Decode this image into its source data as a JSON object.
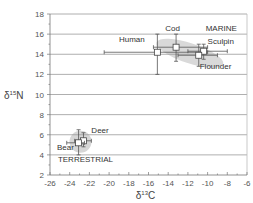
{
  "chart_data": {
    "type": "scatter",
    "title": "",
    "xlabel": "δ13C",
    "ylabel": "δ15N",
    "xlabel_parts": {
      "base": "δ",
      "sup": "13",
      "rest": "C"
    },
    "ylabel_parts": {
      "base": "δ",
      "sup": "15",
      "rest": "N"
    },
    "xlim": [
      -26,
      -6
    ],
    "ylim": [
      2,
      18
    ],
    "x_ticks": [
      -26,
      -24,
      -22,
      -20,
      -18,
      -16,
      -14,
      -12,
      -10,
      -8,
      -6
    ],
    "y_ticks": [
      2,
      4,
      6,
      8,
      10,
      12,
      14,
      16,
      18
    ],
    "grid": {
      "horizontal": true,
      "vertical": false
    },
    "legend": null,
    "series": [
      {
        "name": "Human",
        "x": -15.1,
        "y": 14.2,
        "x_err": [
          -20.5,
          -10.0
        ],
        "y_err": [
          12.0,
          16.0
        ]
      },
      {
        "name": "Cod",
        "x": -13.2,
        "y": 14.7,
        "x_err": [
          -15.5,
          -10.0
        ],
        "y_err": [
          13.3,
          16.0
        ]
      },
      {
        "name": "Sculpin",
        "x": -10.4,
        "y": 14.3,
        "x_err": [
          -12.0,
          -8.0
        ],
        "y_err": [
          13.5,
          15.0
        ]
      },
      {
        "name": "Flounder",
        "x": -10.9,
        "y": 13.9,
        "x_err": [
          -13.0,
          -9.0
        ],
        "y_err": [
          12.8,
          15.0
        ]
      },
      {
        "name": "Deer",
        "x": -22.6,
        "y": 5.4,
        "x_err": [
          -23.5,
          -21.8
        ],
        "y_err": [
          4.8,
          6.2
        ]
      },
      {
        "name": "Bear",
        "x": -23.1,
        "y": 5.2,
        "x_err": [
          -24.3,
          -22.5
        ],
        "y_err": [
          4.0,
          6.5
        ]
      }
    ],
    "annotations": [
      {
        "text": "MARINE",
        "x": -10.2,
        "y": 16.3
      },
      {
        "text": "TERRESTRIAL",
        "x": -25.2,
        "y": 3.3
      },
      {
        "text": "Human",
        "x": -19.0,
        "y": 15.2
      },
      {
        "text": "Cod",
        "x": -14.3,
        "y": 16.3
      },
      {
        "text": "Sculpin",
        "x": -10.0,
        "y": 15.0
      },
      {
        "text": "Flounder",
        "x": -10.8,
        "y": 12.5
      },
      {
        "text": "Deer",
        "x": -21.8,
        "y": 6.2
      },
      {
        "text": "Bear",
        "x": -25.3,
        "y": 4.5
      }
    ],
    "regions": [
      {
        "name": "marine-cluster",
        "shape": "ellipse",
        "color": "#d9d9d9"
      },
      {
        "name": "terrestrial-cluster",
        "shape": "circle",
        "color": "#d9d9d9"
      }
    ]
  }
}
